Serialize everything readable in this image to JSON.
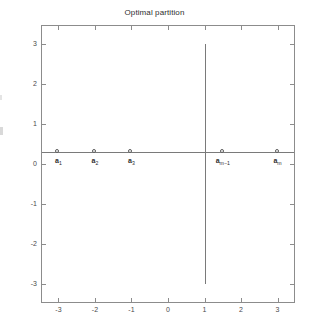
{
  "figure": {
    "background_color": "#ffffff",
    "axes_color": "#8c8c8c",
    "line_color": "#7a7a7a",
    "text_color": "#2e2e2e"
  },
  "chart_data": {
    "type": "scatter",
    "title": "Optimal partition",
    "xlabel": "",
    "ylabel": "",
    "xlim": [
      -3.45,
      3.45
    ],
    "ylim": [
      -3.45,
      3.45
    ],
    "grid": false,
    "legend": null,
    "x_ticks": [
      -3,
      -2,
      -1,
      0,
      1,
      2,
      3
    ],
    "x_ticklabels": [
      "-3",
      "-2",
      "-1",
      "0",
      "1",
      "2",
      "3"
    ],
    "y_ticks": [
      -3,
      -2,
      -1,
      0,
      1,
      2,
      3
    ],
    "y_ticklabels": [
      "-3",
      "-2",
      "-1",
      "0",
      "1",
      "2",
      "3"
    ],
    "series": [
      {
        "name": "partition points",
        "marker": "circle-open",
        "y_value": 0.3,
        "x": [
          -3,
          -2,
          -1,
          1.5,
          3
        ],
        "y": [
          0.3,
          0.3,
          0.3,
          0.3,
          0.3
        ],
        "point_labels": [
          "a1",
          "a2",
          "a3",
          "am-1",
          "am"
        ],
        "point_label_base": [
          "a",
          "a",
          "a",
          "a",
          "a"
        ],
        "point_label_sub": [
          "1",
          "2",
          "3",
          "m−1",
          "m"
        ]
      }
    ],
    "annotations": [
      {
        "name": "horizontal-axis-line",
        "type": "hline",
        "y": 0.3,
        "x_from": -3.45,
        "x_to": 3.45
      },
      {
        "name": "vertical-partition-line",
        "type": "vline",
        "x": 1,
        "y_from": -3,
        "y_to": 3
      }
    ]
  },
  "axis_tick_labels": {
    "x": [
      "-3",
      "-2",
      "-1",
      "0",
      "1",
      "2",
      "3"
    ],
    "y": [
      "3",
      "2",
      "1",
      "0",
      "-1",
      "-2",
      "-3"
    ]
  },
  "point_labels": [
    {
      "base": "a",
      "sub": "1"
    },
    {
      "base": "a",
      "sub": "2"
    },
    {
      "base": "a",
      "sub": "3"
    },
    {
      "base": "a",
      "sub": "m−1"
    },
    {
      "base": "a",
      "sub": "m"
    }
  ]
}
